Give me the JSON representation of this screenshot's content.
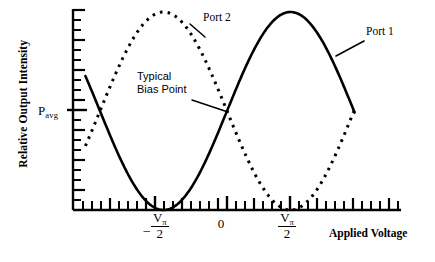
{
  "figure": {
    "background": "#ffffff",
    "ink_color": "#000000"
  },
  "axes": {
    "y_title": "Relative Output Intensity",
    "x_title": "Applied Voltage",
    "y_marker_label": {
      "base": "P",
      "subscript": "avg"
    },
    "x_tick_labels": [
      {
        "id": "neg-vpi-over-2",
        "numerator": "V",
        "numerator_sub": "π",
        "denominator": "2",
        "sign": "–",
        "display": "-Vπ/2"
      },
      {
        "id": "zero",
        "display": "0"
      },
      {
        "id": "pos-vpi-over-2",
        "numerator": "V",
        "numerator_sub": "π",
        "denominator": "2",
        "sign": "",
        "display": "Vπ/2"
      }
    ]
  },
  "annotations": {
    "port2": "Port 2",
    "port1": "Port 1",
    "bias_line1": "Typical",
    "bias_line2": "Bias Point"
  },
  "chart_data": {
    "type": "line",
    "title": "",
    "subtitle": "",
    "xlabel": "Applied Voltage",
    "ylabel": "Relative Output Intensity",
    "xlim": [
      -1.5,
      1.5
    ],
    "ylim": [
      0,
      1
    ],
    "grid": false,
    "legend": "inline callout labels",
    "x_tick_values": [
      -0.5,
      0,
      0.5
    ],
    "x_tick_text": [
      "-Vπ/2",
      "0",
      "Vπ/2"
    ],
    "y_tick_values": [
      0.5
    ],
    "y_tick_text": [
      "P_avg"
    ],
    "y_minor_ticks": true,
    "x_minor_ticks": true,
    "series": [
      {
        "name": "Port 1",
        "style": "solid",
        "linewidth": 2.6,
        "color": "#000000",
        "formula": "y = 0.5 * (1 + sin(pi * x))",
        "x": [
          -1.1,
          -1.0,
          -0.9,
          -0.8,
          -0.7,
          -0.6,
          -0.5,
          -0.4,
          -0.3,
          -0.2,
          -0.1,
          0.0,
          0.1,
          0.2,
          0.3,
          0.4,
          0.5,
          0.6,
          0.7,
          0.8,
          0.9,
          1.0,
          1.1
        ],
        "y": [
          0.655,
          0.5,
          0.345,
          0.206,
          0.095,
          0.024,
          0.0,
          0.024,
          0.095,
          0.206,
          0.345,
          0.5,
          0.655,
          0.794,
          0.905,
          0.976,
          1.0,
          0.976,
          0.905,
          0.794,
          0.655,
          0.5,
          0.345
        ]
      },
      {
        "name": "Port 2",
        "style": "dotted",
        "linewidth": 3.0,
        "color": "#000000",
        "formula": "y = 0.5 * (1 - sin(pi * x))",
        "x": [
          -1.1,
          -1.0,
          -0.9,
          -0.8,
          -0.7,
          -0.6,
          -0.5,
          -0.4,
          -0.3,
          -0.2,
          -0.1,
          0.0,
          0.1,
          0.2,
          0.3,
          0.4,
          0.5,
          0.6,
          0.7,
          0.8,
          0.9,
          1.0,
          1.1
        ],
        "y": [
          0.345,
          0.5,
          0.655,
          0.794,
          0.905,
          0.976,
          1.0,
          0.976,
          0.905,
          0.794,
          0.655,
          0.5,
          0.345,
          0.206,
          0.095,
          0.024,
          0.0,
          0.024,
          0.095,
          0.206,
          0.345,
          0.5,
          0.655
        ]
      }
    ],
    "annotations": [
      {
        "text": "Port 2",
        "target_x": -0.38,
        "target_y": 0.96
      },
      {
        "text": "Port 1",
        "target_x": 0.78,
        "target_y": 0.82
      },
      {
        "text": "Typical Bias Point",
        "target_x": 0.0,
        "target_y": 0.5
      }
    ]
  }
}
